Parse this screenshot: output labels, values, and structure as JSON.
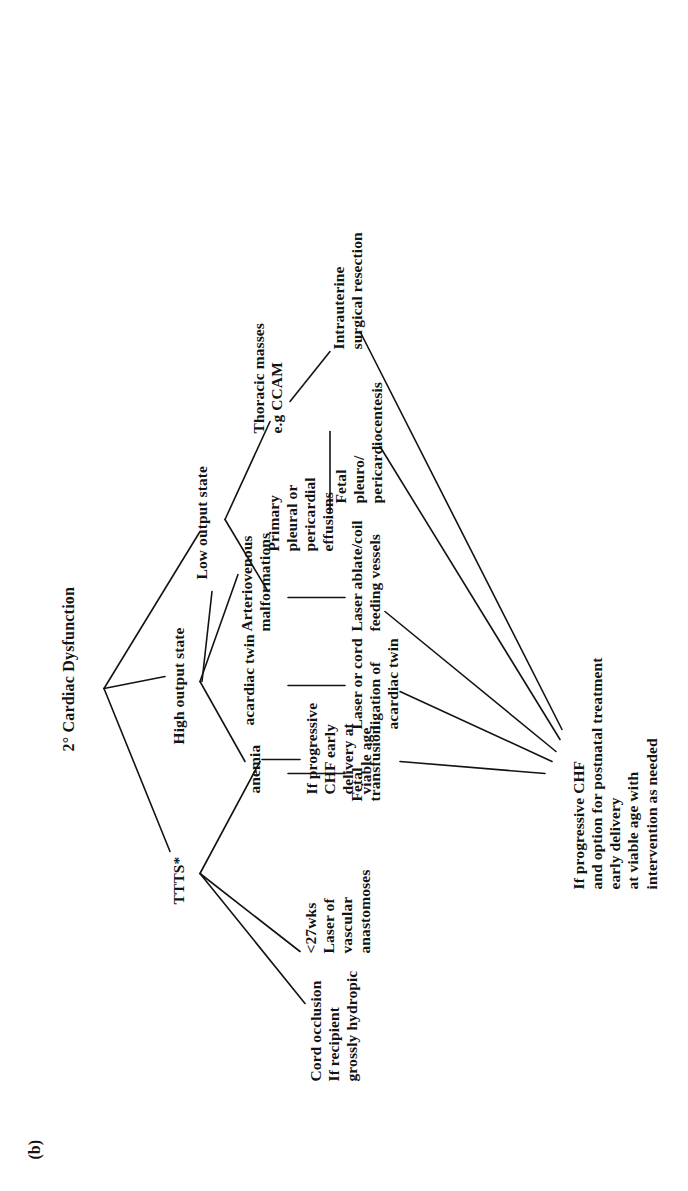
{
  "figure": {
    "panel_label": "(b)",
    "title": "2° Cardiac Dysfunction"
  },
  "diagram": {
    "type": "tree-flowchart",
    "orientation": "rotated-90-ccw",
    "root": "2° Cardiac Dysfunction",
    "nodes": {
      "ttts": "TTTS*",
      "high_output": "High output state",
      "low_output": "Low output state",
      "cord_occlusion": "Cord occlusion\nIf recipient\ngrossly hydropic",
      "laser_anastomoses": "<27wks\nLaser of\nvascular\nanastomoses",
      "ttts_chf": "If progressive\nCHF early\ndelivery at\nviable age",
      "anemia": "anemia",
      "acardiac_twin": "acardiac twin",
      "avm": "Arteriovenous\nmalformations",
      "fetal_transfusion": "Fetal\ntransfusion",
      "laser_cord_ligation": "Laser or cord\nligation of\nacardiac twin",
      "laser_ablate_coil": "Laser ablate/coil\nfeeding vessels",
      "effusions": "Primary\npleural or\npericardial\neffusions",
      "thoracic_masses": "Thoracic masses\ne.g CCAM",
      "fetal_pleuro": "Fetal\npleuro/\npericardiocentesis",
      "intrauterine_resection": "Intrauterine\nsurgical resection",
      "outcome_chf": "If progressive CHF\nand option for postnatal treatment\nearly delivery\nat viable age with\n intervention as needed"
    },
    "edges": [
      {
        "from": "root",
        "to": "ttts"
      },
      {
        "from": "root",
        "to": "high_output"
      },
      {
        "from": "root",
        "to": "low_output"
      },
      {
        "from": "ttts",
        "to": "cord_occlusion"
      },
      {
        "from": "ttts",
        "to": "laser_anastomoses"
      },
      {
        "from": "ttts",
        "to": "ttts_chf"
      },
      {
        "from": "high_output",
        "to": "anemia"
      },
      {
        "from": "high_output",
        "to": "acardiac_twin"
      },
      {
        "from": "high_output",
        "to": "avm"
      },
      {
        "from": "anemia",
        "to": "fetal_transfusion"
      },
      {
        "from": "acardiac_twin",
        "to": "laser_cord_ligation"
      },
      {
        "from": "avm",
        "to": "laser_ablate_coil"
      },
      {
        "from": "low_output",
        "to": "effusions"
      },
      {
        "from": "low_output",
        "to": "thoracic_masses"
      },
      {
        "from": "effusions",
        "to": "fetal_pleuro"
      },
      {
        "from": "thoracic_masses",
        "to": "intrauterine_resection"
      },
      {
        "from": "fetal_transfusion",
        "to": "outcome_chf"
      },
      {
        "from": "laser_cord_ligation",
        "to": "outcome_chf"
      },
      {
        "from": "laser_ablate_coil",
        "to": "outcome_chf"
      },
      {
        "from": "fetal_pleuro",
        "to": "outcome_chf"
      },
      {
        "from": "intrauterine_resection",
        "to": "outcome_chf"
      }
    ],
    "colors": {
      "ink": "#131313",
      "background": "#ffffff"
    }
  }
}
